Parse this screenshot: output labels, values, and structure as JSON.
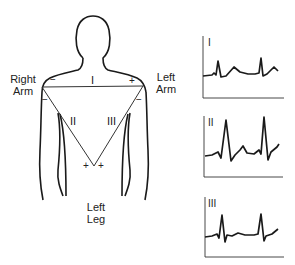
{
  "figure": {
    "limbs": {
      "right_arm": {
        "line1": "Right",
        "line2": "Arm"
      },
      "left_arm": {
        "line1": "Left",
        "line2": "Arm"
      },
      "left_leg": {
        "line1": "Left",
        "line2": "Leg"
      }
    },
    "leads": [
      {
        "name": "I",
        "negative": "Right Arm",
        "positive": "Left Arm",
        "neg_sign": "−",
        "pos_sign": "+"
      },
      {
        "name": "II",
        "negative": "Right Arm",
        "positive": "Left Leg",
        "neg_sign": "−",
        "pos_sign": "+"
      },
      {
        "name": "III",
        "negative": "Left Arm",
        "positive": "Left Leg",
        "neg_sign": "−",
        "pos_sign": "+"
      }
    ],
    "ecg_panels": [
      {
        "label": "I",
        "description": "Lead I tracing: moderate upright R waves, upright T waves"
      },
      {
        "label": "II",
        "description": "Lead II tracing: tallest upright R waves, upright T waves"
      },
      {
        "label": "III",
        "description": "Lead III tracing: smaller R waves with deep S, flat T waves"
      }
    ],
    "colors": {
      "line": "#1a1a1a",
      "background": "#ffffff"
    }
  }
}
